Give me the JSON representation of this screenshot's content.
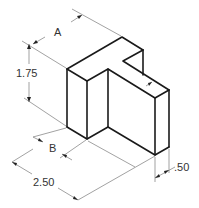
{
  "figure": {
    "type": "isometric technical drawing",
    "object": "T-shaped block with notch"
  },
  "dimensions": {
    "a": {
      "label": "A"
    },
    "height": {
      "label": "1.75"
    },
    "b": {
      "label": "B"
    },
    "length": {
      "label": "2.50"
    },
    "thickness": {
      "label": ".50"
    }
  },
  "colors": {
    "object_line": "#1a1a1a",
    "dimension_line": "#7a7a7a",
    "text": "#333333",
    "background": "#ffffff"
  }
}
